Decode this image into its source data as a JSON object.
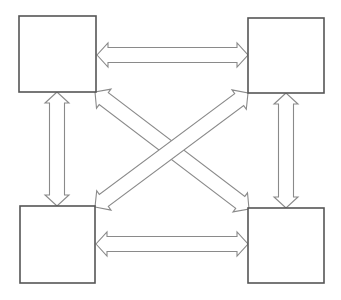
{
  "diagram": {
    "type": "four-node fully-connected bidirectional diagram",
    "colors": {
      "background": "#ffffff",
      "box_stroke": "#555555",
      "arrow_stroke": "#8a8a8a",
      "arrow_fill": "#ffffff"
    },
    "nodes": [
      {
        "id": "top-left",
        "label": "",
        "x": 19,
        "y": 16,
        "w": 77,
        "h": 76
      },
      {
        "id": "top-right",
        "label": "",
        "x": 248,
        "y": 18,
        "w": 76,
        "h": 75
      },
      {
        "id": "bottom-left",
        "label": "",
        "x": 20,
        "y": 206,
        "w": 75,
        "h": 77
      },
      {
        "id": "bottom-right",
        "label": "",
        "x": 248,
        "y": 208,
        "w": 76,
        "h": 75
      }
    ],
    "edges": [
      {
        "id": "top-horizontal",
        "from": "top-left",
        "to": "top-right",
        "bidirectional": true,
        "x1": 97,
        "y1": 55,
        "x2": 248,
        "y2": 55
      },
      {
        "id": "bottom-horizontal",
        "from": "bottom-left",
        "to": "bottom-right",
        "bidirectional": true,
        "x1": 96,
        "y1": 244,
        "x2": 248,
        "y2": 244
      },
      {
        "id": "left-vertical",
        "from": "top-left",
        "to": "bottom-left",
        "bidirectional": true,
        "x1": 57,
        "y1": 92,
        "x2": 57,
        "y2": 206
      },
      {
        "id": "right-vertical",
        "from": "top-right",
        "to": "bottom-right",
        "bidirectional": true,
        "x1": 286,
        "y1": 93,
        "x2": 286,
        "y2": 208
      },
      {
        "id": "diagonal-tl-br",
        "from": "top-left",
        "to": "bottom-right",
        "bidirectional": true,
        "x1": 95,
        "y1": 92,
        "x2": 249,
        "y2": 209
      },
      {
        "id": "diagonal-bl-tr",
        "from": "bottom-left",
        "to": "top-right",
        "bidirectional": true,
        "x1": 95,
        "y1": 207,
        "x2": 248,
        "y2": 93
      }
    ],
    "arrow_style": {
      "shaft_half_width": 7.5,
      "head_half_width": 12,
      "head_length": 11
    }
  }
}
